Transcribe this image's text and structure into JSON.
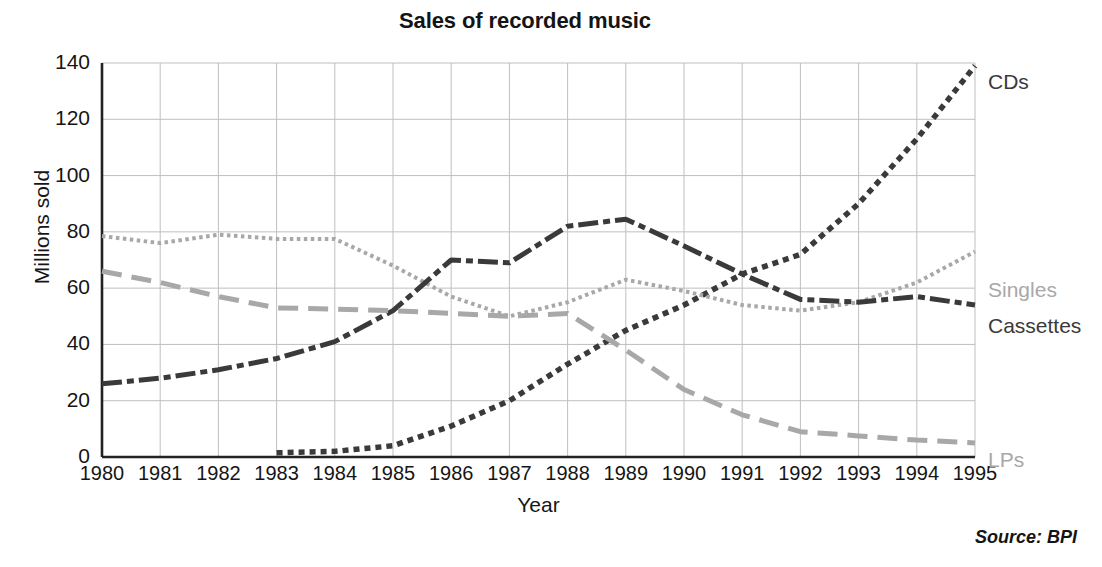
{
  "chart_data": {
    "type": "line",
    "title": "Sales of recorded music",
    "xlabel": "Year",
    "ylabel": "Millions sold",
    "source": "Source: BPI",
    "x": [
      1980,
      1981,
      1982,
      1983,
      1984,
      1985,
      1986,
      1987,
      1988,
      1989,
      1990,
      1991,
      1992,
      1993,
      1994,
      1995
    ],
    "xticklabels": [
      "1980",
      "1981",
      "1982",
      "1983",
      "1984",
      "1985",
      "1986",
      "1987",
      "1988",
      "1989",
      "1990",
      "1991",
      "1992",
      "1993",
      "1994",
      "1995"
    ],
    "yticks": [
      0,
      20,
      40,
      60,
      80,
      100,
      120,
      140
    ],
    "yticklabels": [
      "0",
      "20",
      "40",
      "60",
      "80",
      "100",
      "120",
      "140"
    ],
    "ylim": [
      0,
      140
    ],
    "xlim": [
      1980,
      1995
    ],
    "grid": true,
    "legend_position": "right-inline-labels",
    "series": [
      {
        "name": "CDs",
        "label": "CDs",
        "color": "#3a3a3a",
        "dash": "dotted-thick",
        "label_y": 70,
        "values": [
          null,
          null,
          null,
          1.5,
          2,
          4,
          11,
          20,
          33,
          45,
          54,
          65,
          72,
          90,
          113,
          139
        ]
      },
      {
        "name": "Singles",
        "label": "Singles",
        "color": "#a8a8a8",
        "dash": "dotted-fine",
        "label_y": 278,
        "values": [
          78.5,
          76,
          79,
          77.5,
          77.5,
          68,
          57,
          50,
          55,
          63,
          59,
          54,
          52,
          55,
          62,
          73
        ]
      },
      {
        "name": "Cassettes",
        "label": "Cassettes",
        "color": "#3a3a3a",
        "dash": "dash-dot",
        "label_y": 314,
        "values": [
          26,
          28,
          31,
          35,
          41,
          52,
          70,
          69,
          82,
          84.5,
          75,
          65,
          56,
          55,
          57,
          54
        ]
      },
      {
        "name": "LPs",
        "label": "LPs",
        "color": "#a8a8a8",
        "dash": "dashed-long",
        "label_y": 448,
        "values": [
          66,
          62,
          57,
          53,
          52.5,
          52,
          51,
          50,
          51,
          38,
          24,
          15,
          9,
          7.5,
          6,
          5
        ]
      }
    ]
  },
  "colors": {
    "axis": "#222222",
    "grid": "#bfbfbf",
    "dark_series": "#3a3a3a",
    "light_series": "#a8a8a8",
    "text": "#151515"
  }
}
